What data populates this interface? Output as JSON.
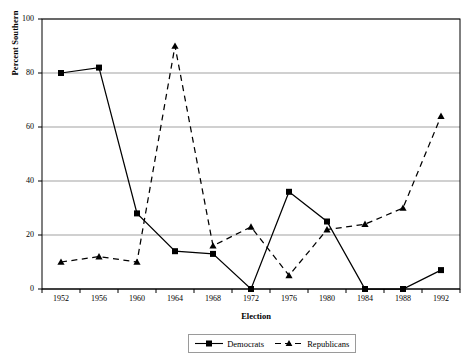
{
  "chart_data": {
    "type": "line",
    "title": "",
    "xlabel": "Election",
    "ylabel": "Percent Southern",
    "categories": [
      "1952",
      "1956",
      "1960",
      "1964",
      "1968",
      "1972",
      "1976",
      "1980",
      "1984",
      "1988",
      "1992"
    ],
    "x": [
      1952,
      1956,
      1960,
      1964,
      1968,
      1972,
      1976,
      1980,
      1984,
      1988,
      1992
    ],
    "xlim": [
      1950,
      1994
    ],
    "ylim": [
      0,
      100
    ],
    "yticks": [
      0,
      20,
      40,
      60,
      80,
      100
    ],
    "ytick_labels": [
      "0",
      "20",
      "40",
      "60",
      "80",
      "100"
    ],
    "grid": "horizontal",
    "legend_position": "bottom-center",
    "series": [
      {
        "name": "Democrats",
        "marker": "square",
        "linestyle": "solid",
        "color": "#000000",
        "values": [
          80,
          82,
          28,
          14,
          13,
          0,
          36,
          25,
          0,
          0,
          7
        ]
      },
      {
        "name": "Republicans",
        "marker": "triangle",
        "linestyle": "dashed",
        "color": "#000000",
        "values": [
          10,
          12,
          10,
          90,
          16,
          23,
          5,
          22,
          24,
          30,
          64
        ]
      }
    ]
  },
  "legend": {
    "entries": [
      {
        "label": "Democrats"
      },
      {
        "label": "Republicans"
      }
    ]
  },
  "axes": {
    "x_title": "Election",
    "y_title": "Percent Southern"
  }
}
